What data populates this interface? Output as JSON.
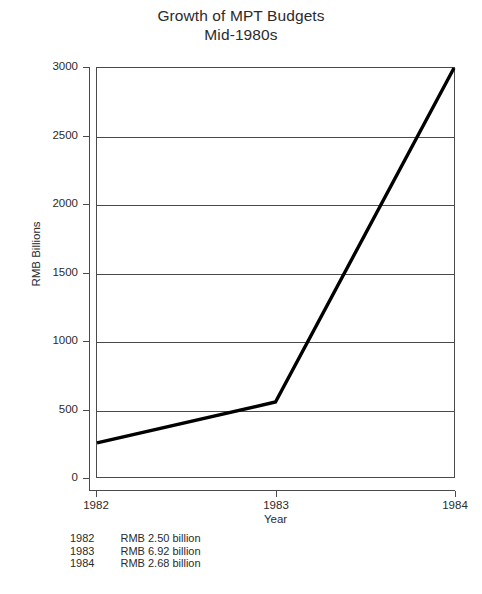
{
  "chart_data": {
    "type": "line",
    "title": "Growth of MPT Budgets",
    "subtitle": "Mid-1980s",
    "xlabel": "Year",
    "ylabel": "RMB Billions",
    "x": [
      "1982",
      "1983",
      "1984"
    ],
    "categories": [
      "1982",
      "1983",
      "1984"
    ],
    "values": [
      250,
      550,
      3000
    ],
    "series": [
      {
        "name": "MPT Budget",
        "values": [
          250,
          550,
          3000
        ]
      }
    ],
    "xlim": [
      "1982",
      "1984"
    ],
    "ylim": [
      0,
      3000
    ],
    "ytick_labels": [
      "0",
      "500",
      "1000",
      "1500",
      "2000",
      "2500",
      "3000"
    ],
    "ytick_values": [
      0,
      500,
      1000,
      1500,
      2000,
      2500,
      3000
    ],
    "xtick_labels": [
      "1982",
      "1983",
      "1984"
    ],
    "grid": "horizontal",
    "legend": "none",
    "line_color": "#000000",
    "axis_color": "#4a4a4a",
    "background": "#ffffff"
  },
  "title": {
    "line1": "Growth of MPT Budgets",
    "line2": "Mid-1980s"
  },
  "axes": {
    "y_title": "RMB Billions",
    "x_title": "Year"
  },
  "footnote": {
    "rows": [
      {
        "year": "1982",
        "amount": "RMB 2.50 billion"
      },
      {
        "year": "1983",
        "amount": "RMB 6.92 billion"
      },
      {
        "year": "1984",
        "amount": "RMB 2.68 billion"
      }
    ]
  }
}
